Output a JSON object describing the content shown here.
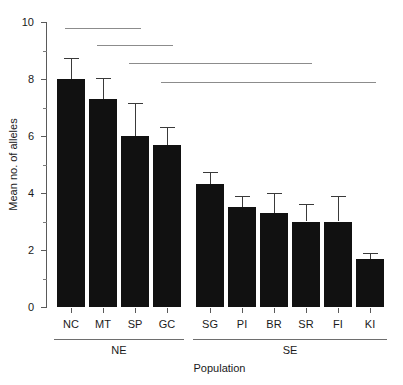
{
  "chart_data": {
    "type": "bar",
    "title": "",
    "xlabel": "Population",
    "ylabel": "Mean no. of alleles",
    "categories": [
      "NC",
      "MT",
      "SP",
      "GC",
      "SG",
      "PI",
      "BR",
      "SR",
      "FI",
      "KI"
    ],
    "values": [
      8.0,
      7.3,
      6.0,
      5.7,
      4.3,
      3.5,
      3.3,
      3.0,
      3.0,
      1.7
    ],
    "error_upper": [
      0.75,
      0.75,
      1.15,
      0.6,
      0.45,
      0.4,
      0.7,
      0.6,
      0.9,
      0.2
    ],
    "error_bar_tops": [
      8.75,
      8.05,
      7.15,
      6.3,
      4.75,
      3.9,
      4.0,
      3.6,
      3.9,
      1.9
    ],
    "ylim": [
      0,
      10
    ],
    "yticks_major": [
      0,
      2,
      4,
      6,
      8,
      10
    ],
    "ytick_labels": [
      "0",
      "2",
      "4",
      "6",
      "8",
      "10"
    ],
    "yticks_minor": [
      1,
      3,
      5,
      7,
      9
    ],
    "grid": false,
    "legend": "none",
    "bar_color": "#111111",
    "error_color": "#3a3a3a",
    "axis_color": "#5a5a5a",
    "significance_line_color": "#8c8c8c",
    "groups": [
      {
        "label": "NE",
        "members": [
          "NC",
          "MT",
          "SP",
          "GC"
        ]
      },
      {
        "label": "SE",
        "members": [
          "SG",
          "PI",
          "BR",
          "SR",
          "FI",
          "KI"
        ]
      }
    ],
    "significance_lines": [
      {
        "from": "NC",
        "to": "SP",
        "y": 9.8
      },
      {
        "from": "MT",
        "to": "GC",
        "y": 9.2
      },
      {
        "from": "SP",
        "to": "SR",
        "y": 8.55
      },
      {
        "from": "GC",
        "to": "KI",
        "y": 7.9
      }
    ]
  }
}
